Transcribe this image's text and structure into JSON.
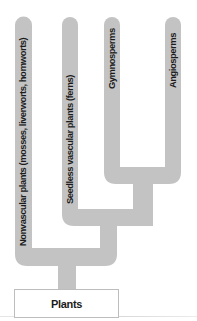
{
  "diagram": {
    "type": "cladogram",
    "root": {
      "label": "Plants"
    },
    "branches": [
      {
        "id": "nonvascular",
        "label": "Nonvascular plants (mosses, liverworts, hornworts)"
      },
      {
        "id": "seedless",
        "label": "Seedless vascular plants (ferns)"
      },
      {
        "id": "gymnosperms",
        "label": "Gymnosperms"
      },
      {
        "id": "angiosperms",
        "label": "Angiosperms"
      }
    ],
    "structure": "((((Gymnosperms, Angiosperms), Seedless vascular plants (ferns)), Nonvascular plants (mosses, liverworts, hornworts)) Plants)",
    "colors": {
      "branch_fill": "#c3c3c3",
      "text": "#1c1c1c",
      "root_border": "#bdbdbd"
    }
  }
}
